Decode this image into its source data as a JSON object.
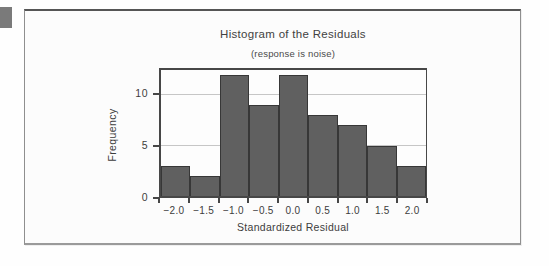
{
  "chart_data": {
    "type": "bar",
    "variant": "histogram",
    "title": "Histogram of the Residuals",
    "subtitle": "(response is noise)",
    "xlabel": "Standardized Residual",
    "ylabel": "Frequency",
    "categories": [
      "−2.0",
      "−1.5",
      "−1.0",
      "−0.5",
      "0.0",
      "0.5",
      "1.0",
      "1.5",
      "2.0"
    ],
    "bin_centers": [
      -2.0,
      -1.5,
      -1.0,
      -0.5,
      0.0,
      0.5,
      1.0,
      1.5,
      2.0
    ],
    "bin_width": 0.5,
    "values": [
      3,
      2,
      12,
      9,
      12,
      8,
      7,
      5,
      3
    ],
    "ylim": [
      0,
      12.5
    ],
    "yticks": [
      0,
      5,
      10
    ],
    "ytick_labels": [
      "0",
      "5",
      "10"
    ],
    "grid": "horizontal gridlines at y=5 and y=10",
    "legend": "none",
    "colors": {
      "bar_fill": "#606060",
      "bar_border": "#373737",
      "gridline": "#c6c6c6",
      "axis_frame": "#474747",
      "text": "#3d3d3d",
      "figure_background": "#fcfcfc",
      "figure_border": "#8f8f8f",
      "page_background": "#fefefe",
      "margin_square": "#7a7a7a"
    }
  }
}
